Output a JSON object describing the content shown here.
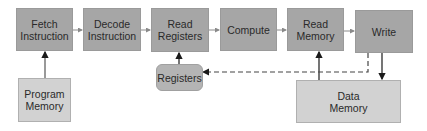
{
  "diagram": {
    "pipeline_stages": [
      {
        "id": "fetch",
        "label": "Fetch\nInstruction"
      },
      {
        "id": "decode",
        "label": "Decode\nInstruction"
      },
      {
        "id": "read_registers",
        "label": "Read\nRegisters"
      },
      {
        "id": "compute",
        "label": "Compute"
      },
      {
        "id": "read_memory",
        "label": "Read\nMemory"
      },
      {
        "id": "write",
        "label": "Write"
      }
    ],
    "storage": [
      {
        "id": "program_memory",
        "label": "Program\nMemory"
      },
      {
        "id": "registers",
        "label": "Registers"
      },
      {
        "id": "data_memory",
        "label": "Data\nMemory"
      }
    ],
    "edges": [
      {
        "from": "fetch",
        "to": "decode",
        "style": "solid"
      },
      {
        "from": "decode",
        "to": "read_registers",
        "style": "solid"
      },
      {
        "from": "read_registers",
        "to": "compute",
        "style": "solid"
      },
      {
        "from": "compute",
        "to": "read_memory",
        "style": "solid"
      },
      {
        "from": "read_memory",
        "to": "write",
        "style": "solid"
      },
      {
        "from": "program_memory",
        "to": "fetch",
        "style": "solid"
      },
      {
        "from": "registers",
        "to": "read_registers",
        "style": "solid"
      },
      {
        "from": "data_memory",
        "to": "read_memory",
        "style": "solid"
      },
      {
        "from": "write",
        "to": "data_memory",
        "style": "solid"
      },
      {
        "from": "write",
        "to": "registers",
        "style": "dashed"
      }
    ],
    "colors": {
      "stage_fill": "#a6a6a6",
      "storage_fill": "#d2d2d2",
      "line": "#1a1a1a",
      "thin_arrow": "#8a8a8a"
    }
  }
}
